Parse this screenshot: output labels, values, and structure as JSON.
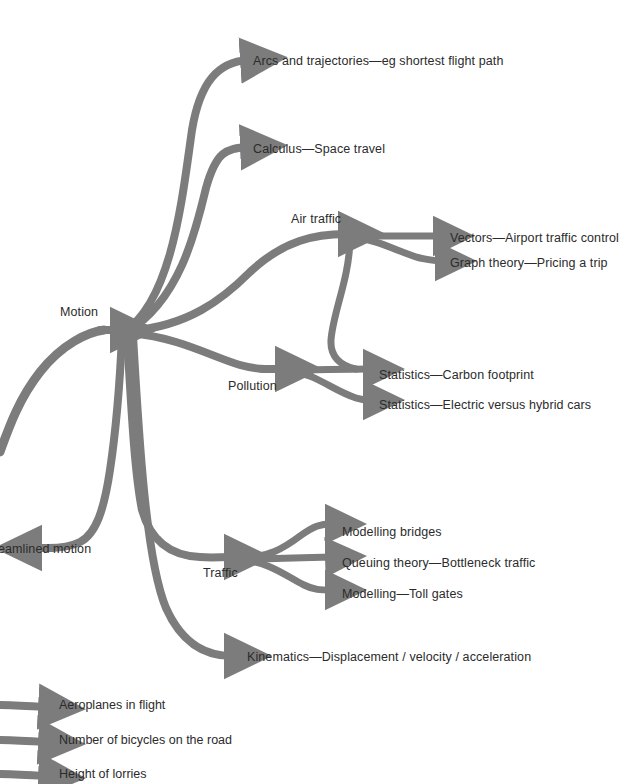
{
  "diagram": {
    "type": "mind-map",
    "title_node": "Motion",
    "stroke_color": "#7c7c7c",
    "text_color": "#2b2b2b",
    "background_color": "#ffffff",
    "center": {
      "label": "Motion",
      "x": 60,
      "y": 312
    },
    "branches": [
      {
        "id": "arcs",
        "label": "Arcs and trajectories—eg shortest flight path",
        "label_x": 253,
        "label_y": 54,
        "level": 1
      },
      {
        "id": "calculus",
        "label": "Calculus—Space travel",
        "label_x": 253,
        "label_y": 142,
        "level": 1
      },
      {
        "id": "air-traffic",
        "label": "Air traffic",
        "label_x": 291,
        "label_y": 212,
        "level": 1
      },
      {
        "id": "vectors",
        "label": "Vectors—Airport traffic control",
        "label_x": 450,
        "label_y": 231,
        "level": 2
      },
      {
        "id": "graph-theory",
        "label": "Graph theory—Pricing a trip",
        "label_x": 450,
        "label_y": 256,
        "level": 2
      },
      {
        "id": "pollution",
        "label": "Pollution",
        "label_x": 228,
        "label_y": 379,
        "level": 1
      },
      {
        "id": "carbon-footprint",
        "label": "Statistics—Carbon footprint",
        "label_x": 379,
        "label_y": 368,
        "level": 2
      },
      {
        "id": "electric-hybrid",
        "label": "Statistics—Electric versus hybrid cars",
        "label_x": 379,
        "label_y": 398,
        "level": 2
      },
      {
        "id": "streamlined",
        "label": "eamlined motion",
        "label_x": 0,
        "label_y": 542,
        "level": 1,
        "clipped_left": true
      },
      {
        "id": "traffic",
        "label": "Traffic",
        "label_x": 203,
        "label_y": 566,
        "level": 1
      },
      {
        "id": "modelling-bridges",
        "label": "Modelling bridges",
        "label_x": 342,
        "label_y": 525,
        "level": 2
      },
      {
        "id": "queuing-theory",
        "label": "Queuing theory—Bottleneck traffic",
        "label_x": 342,
        "label_y": 556,
        "level": 2
      },
      {
        "id": "toll-gates",
        "label": "Modelling—Toll gates",
        "label_x": 342,
        "label_y": 587,
        "level": 2
      },
      {
        "id": "kinematics",
        "label": "Kinematics—Displacement / velocity / acceleration",
        "label_x": 247,
        "label_y": 650,
        "level": 1
      }
    ],
    "legend_items": [
      {
        "id": "aeroplanes",
        "label": "Aeroplanes in flight",
        "label_x": 59,
        "label_y": 705
      },
      {
        "id": "bicycles",
        "label": "Number of bicycles on the road",
        "label_x": 59,
        "label_y": 740
      },
      {
        "id": "lorries",
        "label": "Height of lorries",
        "label_x": 59,
        "label_y": 774
      }
    ]
  }
}
